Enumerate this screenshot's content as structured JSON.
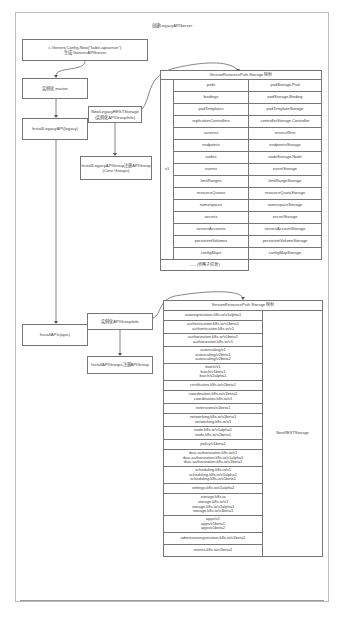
{
  "diagram": {
    "title": "创建LegacyAPIServer",
    "nodes": {
      "generic_config": {
        "line1": "c.GenericConfig.New(\"kube-apiserver\")",
        "line2": "生成 GenericAPIServer"
      },
      "instantiate_master": {
        "label": "实例化 master"
      },
      "install_legacy_api": {
        "label": "InstallLegacyAPI(legacy)"
      },
      "new_legacy_rest_storage": {
        "line1": "NewLegacyRESTStorage",
        "line2": "(实例化APIGroupInfo)"
      },
      "install_legacy_api_group": {
        "line1": "InstallLegacyAPIGroup注册APIGroup",
        "line2": "(Core Groups)"
      },
      "install_apis": {
        "label": "InstallAPIs(apis)"
      },
      "instantiate_api_groups": {
        "label": "实例化APIGroupInfo"
      },
      "install_api_groups": {
        "label": "InstallAPIGroups注册APIGroup"
      }
    },
    "legacy_table": {
      "header": "VersionResourcePath Storage 映射",
      "version_label": "v1",
      "rows": [
        {
          "resource": "pods",
          "storage": "podStorage.Pod"
        },
        {
          "resource": "bindings",
          "storage": "podStorage.Binding"
        },
        {
          "resource": "podTemplates",
          "storage": "podTemplateStorage"
        },
        {
          "resource": "replicationControllers",
          "storage": "controllerStorage.Controller"
        },
        {
          "resource": "services",
          "storage": "serviceRest"
        },
        {
          "resource": "endpoints",
          "storage": "endpointsStorage"
        },
        {
          "resource": "nodes",
          "storage": "nodeStorage.Node"
        },
        {
          "resource": "events",
          "storage": "eventStorage"
        },
        {
          "resource": "limitRanges",
          "storage": "limitRangeStorage"
        },
        {
          "resource": "resourceQuotas",
          "storage": "resourceQuotaStorage"
        },
        {
          "resource": "namespaces",
          "storage": "namespaceStorage"
        },
        {
          "resource": "secrets",
          "storage": "secretStorage"
        },
        {
          "resource": "serviceAccounts",
          "storage": "serviceAccountStorage"
        },
        {
          "resource": "persistentVolumes",
          "storage": "persistentVolumeStorage"
        },
        {
          "resource": "configMaps",
          "storage": "configMapStorage"
        }
      ],
      "footer": "...... (省略子资源)"
    },
    "apis_table": {
      "header": "VersionResourcePath Storage 映射",
      "storage_label": "NewRESTStorage",
      "rows": [
        [
          "autoregistration.k8s.io/v1alpha1"
        ],
        [
          "authentication.k8s.io/v1beta1",
          "authentication.k8s.io/v1"
        ],
        [
          "authorization.k8s.io/v1beta1",
          "authorization.k8s.io/v1"
        ],
        [
          "autoscaling/v1",
          "autoscaling/v2beta1",
          "autoscaling/v2beta2"
        ],
        [
          "batch/v1",
          "batch/v1beta1",
          "batch/v2alpha1"
        ],
        [
          "certificates.k8s.io/v1beta1"
        ],
        [
          "coordination.k8s.io/v1beta1",
          "coordination.k8s.io/v1"
        ],
        [
          "extensions/v1beta1"
        ],
        [
          "networking.k8s.io/v1beta1",
          "networking.k8s.io/v1"
        ],
        [
          "node.k8s.io/v1alpha1",
          "node.k8s.io/v1beta1"
        ],
        [
          "policy/v1beta1"
        ],
        [
          "rbac.authorization.k8s.io/v1",
          "rbac.authorization.k8s.io/v1alpha1",
          "rbac.authorization.k8s.io/v1beta1"
        ],
        [
          "scheduling.k8s.io/v1",
          "scheduling.k8s.io/v1alpha1",
          "scheduling.k8s.io/v1beta1"
        ],
        [
          "settings.k8s.io/v1alpha1"
        ],
        [
          "storage.k8s.io",
          "storage.k8s.io/v1",
          "storage.k8s.io/v1alpha1",
          "storage.k8s.io/v1beta1"
        ],
        [
          "apps/v1",
          "apps/v1beta1",
          "apps/v1beta2"
        ],
        [
          "admissionregistration.k8s.io/v1beta1"
        ],
        [
          "events.k8s.io/v1beta1"
        ]
      ]
    }
  }
}
